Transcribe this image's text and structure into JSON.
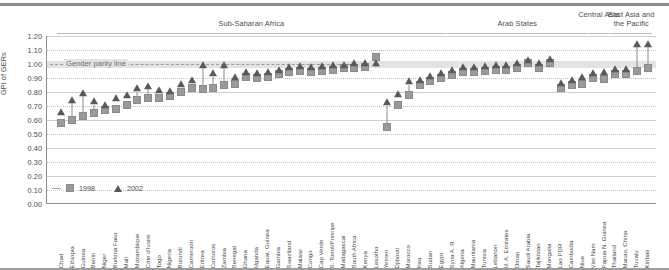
{
  "chart_data": {
    "type": "scatter",
    "title": "",
    "xlabel": "",
    "ylabel": "GPI of GERs",
    "ylim": [
      0.0,
      1.2
    ],
    "ytick_labels": [
      "1.20",
      "1.10",
      "1.00",
      "0.90",
      "0.80",
      "0.70",
      "0.60",
      "0.50",
      "0.40",
      "0.30",
      "0.20",
      "0.10",
      "0.00"
    ],
    "ytick_values": [
      1.2,
      1.1,
      1.0,
      0.9,
      0.8,
      0.7,
      0.6,
      0.5,
      0.4,
      0.3,
      0.2,
      0.1,
      0.0
    ],
    "grid": true,
    "legend_position": "bottom-left",
    "annotations": [
      {
        "text": "Gender parity line",
        "value": 1.0
      }
    ],
    "series": [
      {
        "name": "1998",
        "marker": "square",
        "color": "#9a9a9a"
      },
      {
        "name": "2002",
        "marker": "triangle",
        "color": "#595959"
      }
    ],
    "groups": [
      {
        "label": "Sub-Saharan Africa",
        "start": 0,
        "end": 35
      },
      {
        "label": "Arab States",
        "start": 36,
        "end": 48
      },
      {
        "label": "Central Asia",
        "start": 49,
        "end": 50
      },
      {
        "label": "East Asia and\nthe Pacific",
        "start": 51,
        "end": 59
      }
    ],
    "categories": [
      "Chad",
      "Ethiopia",
      "Guinea",
      "Benin",
      "Niger",
      "Burkina Faso",
      "Mali",
      "Mozambique",
      "Côte d'Ivoire",
      "Togo",
      "Nigeria",
      "Burundi",
      "Cameroon",
      "Eritrea",
      "Comoros",
      "Zambia",
      "Senegal",
      "Ghana",
      "Uganda",
      "Equat. Guinea",
      "Gambia",
      "Swaziland",
      "Malawi",
      "Congo",
      "Cap Verde",
      "S. Tomé/Principe",
      "Madagascar",
      "South Africa",
      "Kenya",
      "Lesotho",
      "Yemen",
      "Djibouti",
      "Morocco",
      "Iraq",
      "Sudan",
      "Egypt",
      "Syria A. R.",
      "Algeria",
      "Mauritania",
      "Tunisia",
      "Lebanon",
      "U. A. Emirates",
      "Oman",
      "Saudi Arabia",
      "Tajikistan",
      "Mongolia",
      "Lao PDR",
      "Cambodia",
      "Niue",
      "Viet Nam",
      "Papua N. Guinea",
      "Thailand",
      "Macao, China",
      "Tuvalu",
      "Kiribati"
    ],
    "values_1998": [
      0.58,
      0.6,
      0.63,
      0.65,
      0.67,
      0.68,
      0.71,
      0.74,
      0.76,
      0.76,
      0.77,
      0.8,
      0.83,
      0.82,
      0.83,
      0.85,
      0.86,
      0.91,
      0.9,
      0.91,
      0.93,
      0.94,
      0.95,
      0.94,
      0.95,
      0.96,
      0.97,
      0.97,
      0.98,
      1.05,
      0.55,
      0.71,
      0.78,
      0.85,
      0.88,
      0.9,
      0.92,
      0.94,
      0.94,
      0.95,
      0.96,
      0.96,
      0.97,
      1.01,
      0.97,
      1.01,
      0.83,
      0.85,
      0.86,
      0.9,
      0.89,
      0.93,
      0.93,
      0.95,
      0.97
    ],
    "values_2002": [
      0.63,
      0.72,
      0.77,
      0.71,
      0.68,
      0.73,
      0.75,
      0.8,
      0.82,
      0.79,
      0.78,
      0.83,
      0.86,
      0.97,
      0.91,
      0.97,
      0.88,
      0.92,
      0.91,
      0.92,
      0.93,
      0.95,
      0.96,
      0.95,
      0.96,
      0.97,
      0.97,
      0.98,
      0.98,
      0.98,
      0.7,
      0.76,
      0.85,
      0.86,
      0.89,
      0.91,
      0.93,
      0.95,
      0.95,
      0.96,
      0.97,
      0.97,
      0.98,
      1.0,
      0.98,
      1.01,
      0.84,
      0.86,
      0.88,
      0.91,
      0.92,
      0.94,
      0.94,
      1.12,
      1.12
    ]
  },
  "legend": {
    "series_1998": "1998",
    "series_2002": "2002"
  },
  "axis": {
    "y_title": "GPI of GERs"
  },
  "parity": {
    "label": "Gender parity line"
  }
}
